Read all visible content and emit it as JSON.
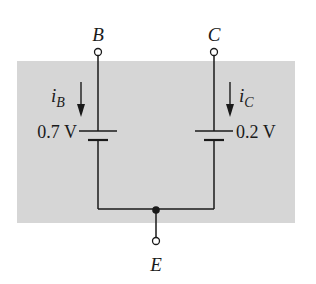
{
  "diagram": {
    "type": "circuit",
    "background_color": "#d6d6d6",
    "wire_color": "#1a1a1a",
    "terminals": {
      "base": {
        "label": "B"
      },
      "collector": {
        "label": "C"
      },
      "emitter": {
        "label": "E"
      }
    },
    "sources": [
      {
        "id": "base-battery",
        "voltage_label": "0.7 V",
        "current_label": "i",
        "current_subscript": "B"
      },
      {
        "id": "collector-battery",
        "voltage_label": "0.2 V",
        "current_label": "i",
        "current_subscript": "C"
      }
    ]
  }
}
